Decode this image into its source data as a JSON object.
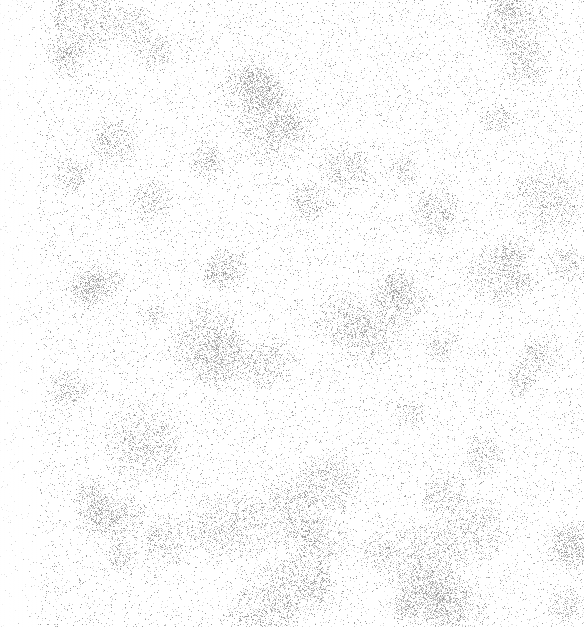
{
  "image": {
    "width": 584,
    "height": 627,
    "description": "Light gray speckled noise texture on white background",
    "background_color": "#ffffff",
    "speckle_colors": [
      "#9a9a9a",
      "#b5b5b5",
      "#cfcfcf",
      "#e2e2e2"
    ],
    "density": {
      "base": 0.05,
      "cluster_boost": 0.22,
      "cluster_count": 70,
      "cluster_radius_min": 12,
      "cluster_radius_max": 45
    },
    "left_margin_lighter": true,
    "seed": 1337
  }
}
